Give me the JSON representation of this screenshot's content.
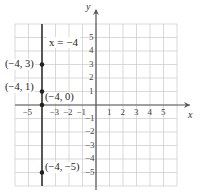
{
  "chart_data": {
    "type": "scatter",
    "title": "",
    "xlabel": "x",
    "ylabel": "y",
    "xlim": [
      -6,
      6
    ],
    "ylim": [
      -6,
      6
    ],
    "grid": true,
    "x_ticks": [
      -5,
      -3,
      -2,
      -1,
      1,
      2,
      3,
      4,
      5
    ],
    "x_tick_labels": [
      "−5",
      "−3",
      "−2",
      "−1",
      "1",
      "2",
      "3",
      "4",
      "5"
    ],
    "y_ticks": [
      5,
      4,
      3,
      2,
      1,
      -1,
      -2,
      -3,
      -4,
      -5
    ],
    "y_tick_labels": [
      "5",
      "4",
      "3",
      "2",
      "1",
      "−1",
      "−2",
      "−3",
      "−4",
      "−5"
    ],
    "line": {
      "equation": "x = −4",
      "type": "vertical",
      "x": -4
    },
    "points": [
      {
        "x": -4,
        "y": 3,
        "label": "(−4, 3)"
      },
      {
        "x": -4,
        "y": 1,
        "label": "(−4, 1)"
      },
      {
        "x": -4,
        "y": 0,
        "label": "(−4, 0)"
      },
      {
        "x": -4,
        "y": -5,
        "label": "(−4, −5)"
      }
    ],
    "colors": {
      "grid": "#cfcfcf",
      "axis": "#555555",
      "line": "#333333",
      "point": "#222222"
    }
  },
  "labels": {
    "x_axis": "x",
    "y_axis": "y",
    "equation": "x = −4",
    "p1": "(−4, 3)",
    "p2": "(−4, 1)",
    "p3": "(−4, 0)",
    "p4": "(−4, −5)"
  }
}
